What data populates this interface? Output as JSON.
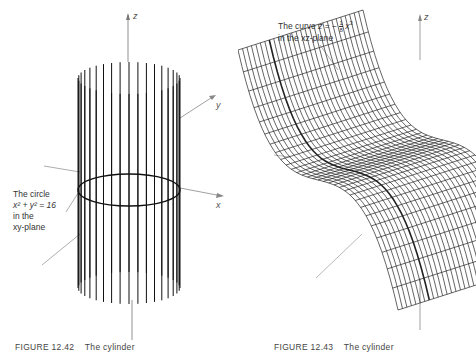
{
  "page_fragment": "(Figure 12.41)",
  "figure_left": {
    "number": "FIGURE 12.42",
    "title": "The cylinder",
    "axes": {
      "z": "z",
      "y": "y",
      "x": "x"
    },
    "annotation": {
      "line1": "The circle",
      "line2_eq": "x² + y² = 16",
      "line3": "in the",
      "line4": "xy-plane"
    },
    "rulings_count": 36
  },
  "figure_right": {
    "number": "FIGURE 12.43",
    "title": "The cylinder",
    "axes": {
      "z": "z"
    },
    "annotation": {
      "prefix": "The curve ",
      "lhs": "z",
      "eq": " = − ",
      "frac_num": "1",
      "frac_den": "8",
      "var": "x",
      "exp": "3",
      "line2": "in the xz-plane"
    }
  }
}
